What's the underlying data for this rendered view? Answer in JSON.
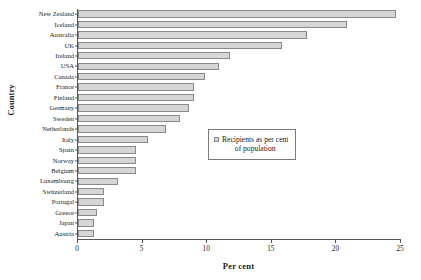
{
  "chart_data": {
    "type": "bar",
    "orientation": "horizontal",
    "title": "",
    "xlabel": "Per cent",
    "ylabel": "Country",
    "xlim": [
      0,
      25
    ],
    "xticks": [
      0,
      5,
      10,
      15,
      20,
      25
    ],
    "grid": false,
    "legend": {
      "position": "middle-right",
      "entries": [
        "Recipients as per cent\nof population"
      ]
    },
    "series_name": "Recipients as per cent of population",
    "categories": [
      "New Zealand",
      "Iceland",
      "Australia",
      "UK",
      "Ireland",
      "USA",
      "Canada",
      "France",
      "Finland",
      "Germany",
      "Sweden",
      "Netherlands",
      "Italy",
      "Spain",
      "Norway",
      "Belgium",
      "Luxembourg",
      "Switzerland",
      "Portugal",
      "Greece",
      "Japan",
      "Austria"
    ],
    "values": [
      24.6,
      20.8,
      17.7,
      15.8,
      11.8,
      10.9,
      9.8,
      9.0,
      9.0,
      8.6,
      7.9,
      6.8,
      5.4,
      4.5,
      4.5,
      4.5,
      3.1,
      2.0,
      2.0,
      1.5,
      1.2,
      1.2
    ],
    "colors": {
      "bar_fill": "#d6d6d6",
      "bar_border": "#8a8a8a",
      "axis": "#555555",
      "text": "#1a1a1a",
      "background": "#ffffff"
    }
  }
}
